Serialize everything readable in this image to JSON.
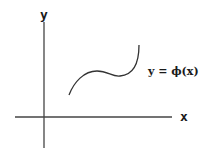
{
  "diagram": {
    "axes": {
      "x_label": "x",
      "y_label": "y"
    },
    "curve_label": "y = ϕ(x)",
    "colors": {
      "stroke": "#333333",
      "text": "#1a1a1a",
      "background": "#ffffff"
    }
  }
}
